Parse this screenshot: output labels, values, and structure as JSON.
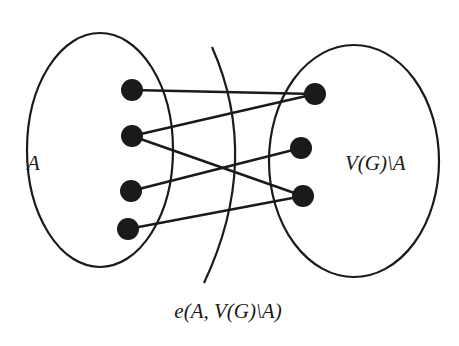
{
  "diagram": {
    "type": "bipartite-cut",
    "colors": {
      "stroke": "#1a1a1a",
      "background": "#ffffff"
    },
    "sets": [
      {
        "id": "A",
        "label": "A",
        "cx": 100,
        "cy": 150,
        "rx": 73,
        "ry": 117,
        "label_x": 27,
        "label_y": 170
      },
      {
        "id": "complement",
        "label": "V(G)\\A",
        "cx": 354,
        "cy": 161,
        "rx": 85,
        "ry": 116,
        "label_x": 345,
        "label_y": 170
      }
    ],
    "vertices": [
      {
        "id": "a1",
        "set": "A",
        "x": 132,
        "y": 90
      },
      {
        "id": "a2",
        "set": "A",
        "x": 132,
        "y": 136
      },
      {
        "id": "a3",
        "set": "A",
        "x": 131,
        "y": 191
      },
      {
        "id": "a4",
        "set": "A",
        "x": 128,
        "y": 229
      },
      {
        "id": "b1",
        "set": "complement",
        "x": 315,
        "y": 94
      },
      {
        "id": "b2",
        "set": "complement",
        "x": 301,
        "y": 148
      },
      {
        "id": "b3",
        "set": "complement",
        "x": 303,
        "y": 196
      }
    ],
    "edges": [
      {
        "from": "a1",
        "to": "b1"
      },
      {
        "from": "a2",
        "to": "b1"
      },
      {
        "from": "a2",
        "to": "b3"
      },
      {
        "from": "a3",
        "to": "b2"
      },
      {
        "from": "a4",
        "to": "b3"
      }
    ],
    "cut": {
      "label": "e(A, V(G)\\A)",
      "path": "M 212 47 Q 262 160 204 283",
      "label_x": 228,
      "label_y": 318
    }
  }
}
